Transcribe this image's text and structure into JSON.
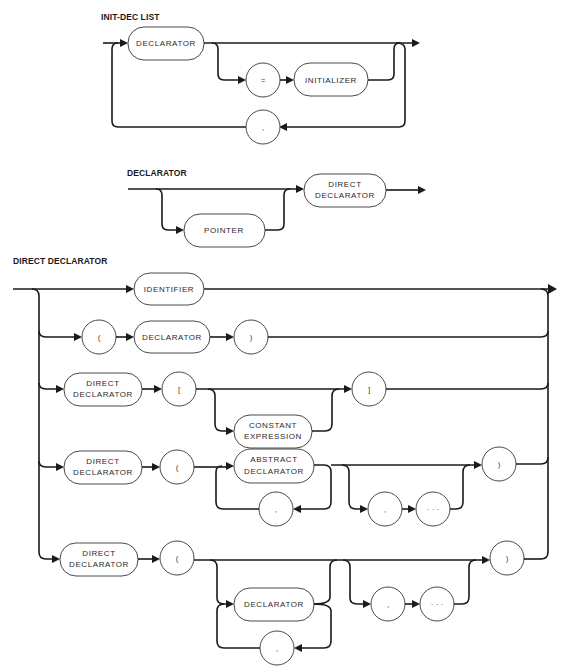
{
  "diagrams": [
    {
      "title": "INIT-DEC LIST",
      "nodes": {
        "declarator": "DECLARATOR",
        "equals": "=",
        "initializer": "INITIALIZER",
        "comma": ","
      }
    },
    {
      "title": "DECLARATOR",
      "nodes": {
        "pointer": "POINTER",
        "direct_declarator_l1": "DIRECT",
        "direct_declarator_l2": "DECLARATOR"
      }
    },
    {
      "title": "DIRECT DECLARATOR",
      "rows": [
        {
          "identifier": "IDENTIFIER"
        },
        {
          "lparen": "(",
          "declarator": "DECLARATOR",
          "rparen": ")"
        },
        {
          "dd_l1": "DIRECT",
          "dd_l2": "DECLARATOR",
          "lbracket": "[",
          "const_l1": "CONSTANT",
          "const_l2": "EXPRESSION",
          "rbracket": "]"
        },
        {
          "dd_l1": "DIRECT",
          "dd_l2": "DECLARATOR",
          "lparen": "(",
          "abs_l1": "ABSTRACT",
          "abs_l2": "DECLARATOR",
          "comma_loop": ",",
          "comma": ",",
          "ellipsis": "· · ·",
          "rparen": ")"
        },
        {
          "dd_l1": "DIRECT",
          "dd_l2": "DECLARATOR",
          "lparen": "(",
          "declarator": "DECLARATOR",
          "comma_loop": ",",
          "comma": ",",
          "ellipsis": "· · ·",
          "rparen": ")"
        }
      ]
    }
  ]
}
